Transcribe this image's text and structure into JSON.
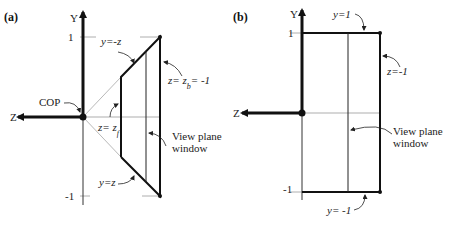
{
  "panel_a": {
    "label": "(a)",
    "axis_y": "Y",
    "axis_z": "Z",
    "tick_top": "1",
    "tick_bottom": "-1",
    "cop": "COP",
    "top_edge": "y=-z",
    "bottom_edge": "y=z",
    "front_plane_main": "z= z",
    "front_plane_sub": "f",
    "back_plane_main": "z= z",
    "back_plane_sub": "b",
    "back_plane_tail": "= -1",
    "view_plane_line1": "View plane",
    "view_plane_line2": "window"
  },
  "panel_b": {
    "label": "(b)",
    "axis_y": "Y",
    "axis_z": "Z",
    "tick_top": "1",
    "tick_bottom": "-1",
    "top_edge": "y=1",
    "bottom_edge": "y= -1",
    "back_plane": "z=-1",
    "view_plane_line1": "View plane",
    "view_plane_line2": "window"
  },
  "colors": {
    "stroke": "#1a1a1a",
    "thin": "#555555",
    "guide": "#999999"
  }
}
